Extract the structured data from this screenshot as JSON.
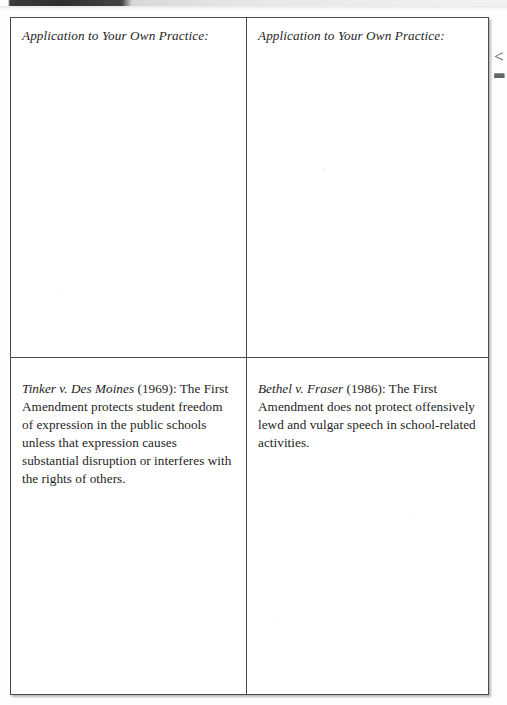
{
  "page": {
    "background_color": "#fdfdfd",
    "outer_margin_color": "#f2f2f2",
    "header_band_color": "#333333",
    "rule_color": "#4a4a4a",
    "text_color": "#232323"
  },
  "margin_mark": {
    "glyph": "<",
    "sub_glyph": "▄▄"
  },
  "table": {
    "rows": [
      {
        "name": "application-row",
        "cells": [
          {
            "name": "application-left",
            "label": "Application to Your Own Practice:",
            "body": ""
          },
          {
            "name": "application-right",
            "label": "Application to Your Own Practice:",
            "body": ""
          }
        ]
      },
      {
        "name": "case-row",
        "cells": [
          {
            "name": "case-left",
            "case_name": "Tinker v. Des Moines",
            "case_body": " (1969): The First Amendment protects student freedom of expression in the public schools unless that expression causes substantial disruption or interferes with the rights of others."
          },
          {
            "name": "case-right",
            "case_name": "Bethel v. Fraser",
            "case_body": " (1986): The First Amendment does not protect offensively lewd and vulgar speech in school-related activities."
          }
        ]
      }
    ]
  }
}
